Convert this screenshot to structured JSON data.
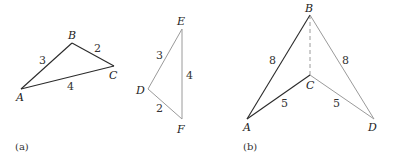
{
  "colors": {
    "dark_edge": "#2a2a2a",
    "light_edge": "#9a9a9a",
    "background": "#ffffff"
  },
  "panel_a": {
    "caption": "(a)",
    "triangle_abc": {
      "vertices": {
        "A": "A",
        "B": "B",
        "C": "C"
      },
      "edges": {
        "AB": "3",
        "BC": "2",
        "AC": "4"
      }
    },
    "triangle_def": {
      "vertices": {
        "D": "D",
        "E": "E",
        "F": "F"
      },
      "edges": {
        "DE": "3",
        "EF": "4",
        "DF": "2"
      }
    }
  },
  "panel_b": {
    "caption": "(b)",
    "vertices": {
      "A": "A",
      "B": "B",
      "C": "C",
      "D": "D"
    },
    "edges": {
      "AB": "8",
      "BD": "8",
      "AC": "5",
      "CD": "5",
      "BC": "dashed"
    }
  }
}
